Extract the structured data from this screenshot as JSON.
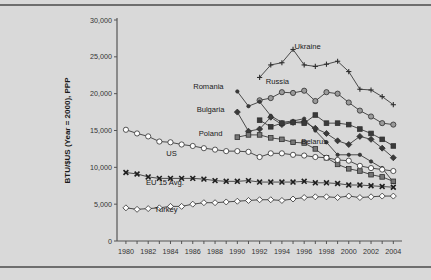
{
  "figure": {
    "background_color": "#d9d9d9",
    "rule_color": "#6e6e6e"
  },
  "chart_data": {
    "type": "line",
    "title": "",
    "xlabel": "",
    "ylabel": "BTU/$US (Year = 2000), PPP",
    "xlim": [
      1979.2,
      2004.6
    ],
    "ylim": [
      0,
      30000
    ],
    "ytick_labels": [
      "0",
      "5,000",
      "10,000",
      "15,000",
      "20,000",
      "25,000",
      "30,000"
    ],
    "ytick_values": [
      0,
      5000,
      10000,
      15000,
      20000,
      25000,
      30000
    ],
    "xtick_labels": [
      "1980",
      "1982",
      "1984",
      "1986",
      "1988",
      "1990",
      "1992",
      "1994",
      "1996",
      "1998",
      "2000",
      "2002",
      "2004"
    ],
    "xtick_values": [
      1980,
      1982,
      1984,
      1986,
      1988,
      1990,
      1992,
      1994,
      1996,
      1998,
      2000,
      2002,
      2004
    ],
    "xtick_minor_values": [
      1981,
      1983,
      1985,
      1987,
      1989,
      1991,
      1993,
      1995,
      1997,
      1999,
      2001,
      2003
    ],
    "grid": false,
    "legend_position": "inline-labels",
    "series": [
      {
        "name": "Ukraine",
        "marker": "plus",
        "marker_fill": "none",
        "label_x": 1996.3,
        "label_y": 26100,
        "x": [
          1992,
          1993,
          1994,
          1995,
          1996,
          1997,
          1998,
          1999,
          2000,
          2001,
          2002,
          2003,
          2004
        ],
        "values": [
          22200,
          23900,
          24200,
          26000,
          23900,
          23700,
          24000,
          24400,
          23000,
          20600,
          20500,
          19600,
          18500
        ]
      },
      {
        "name": "Russia",
        "marker": "circle",
        "marker_fill": "#9a9a9a",
        "label_x": 1993.6,
        "label_y": 21300,
        "x": [
          1992,
          1993,
          1994,
          1995,
          1996,
          1997,
          1998,
          1999,
          2000,
          2001,
          2002,
          2003,
          2004
        ],
        "values": [
          19100,
          19400,
          20200,
          20100,
          20400,
          19000,
          20200,
          20000,
          18800,
          17700,
          16900,
          16000,
          15800
        ]
      },
      {
        "name": "Romania",
        "marker": "dot",
        "marker_fill": "#3a3a3a",
        "label_x": 1987.4,
        "label_y": 20600,
        "x": [
          1990,
          1991,
          1992,
          1993,
          1994,
          1995,
          1996,
          1997,
          1998,
          1999,
          2000,
          2001,
          2002,
          2003,
          2004
        ],
        "values": [
          20300,
          18300,
          18900,
          17000,
          16100,
          16300,
          16600,
          15000,
          13400,
          11700,
          11700,
          11700,
          10800,
          9900,
          8000
        ]
      },
      {
        "name": "Bulgaria",
        "marker": "diamond",
        "marker_fill": "#3a3a3a",
        "label_x": 1987.6,
        "label_y": 17500,
        "x": [
          1990,
          1991,
          1992,
          1993,
          1994,
          1995,
          1996,
          1997,
          1998,
          1999,
          2000,
          2001,
          2002,
          2003,
          2004
        ],
        "values": [
          17500,
          14900,
          15200,
          16800,
          15800,
          16100,
          16200,
          15300,
          14600,
          13600,
          13100,
          14200,
          13800,
          12600,
          11300
        ]
      },
      {
        "name": "Poland",
        "marker": "square",
        "marker_fill": "#777777",
        "label_x": 1987.6,
        "label_y": 14200,
        "x": [
          1990,
          1991,
          1992,
          1993,
          1994,
          1995,
          1996,
          1997,
          1998,
          1999,
          2000,
          2001,
          2002,
          2003,
          2004
        ],
        "values": [
          14100,
          14400,
          14400,
          14000,
          13800,
          13400,
          13300,
          12500,
          11300,
          10400,
          9800,
          9500,
          9000,
          8700,
          8100
        ]
      },
      {
        "name": "Belarus",
        "marker": "square",
        "marker_fill": "#3a3a3a",
        "label_x": 1996.9,
        "label_y": 13100,
        "x": [
          1992,
          1993,
          1994,
          1995,
          1996,
          1997,
          1998,
          1999,
          2000,
          2001,
          2002,
          2003,
          2004
        ],
        "values": [
          16400,
          15500,
          16000,
          16100,
          16000,
          17100,
          16000,
          16000,
          15800,
          15200,
          14600,
          13800,
          12900
        ]
      },
      {
        "name": "US",
        "marker": "circle",
        "marker_fill": "none",
        "label_x": 1984.1,
        "label_y": 11500,
        "x": [
          1980,
          1981,
          1982,
          1983,
          1984,
          1985,
          1986,
          1987,
          1988,
          1989,
          1990,
          1991,
          1992,
          1993,
          1994,
          1995,
          1996,
          1997,
          1998,
          1999,
          2000,
          2001,
          2002,
          2003,
          2004
        ],
        "values": [
          15100,
          14600,
          14200,
          13500,
          13400,
          13100,
          12900,
          12600,
          12400,
          12200,
          12200,
          12100,
          11400,
          11900,
          11900,
          11700,
          11600,
          11400,
          11300,
          11000,
          10900,
          10200,
          9900,
          9700,
          9500
        ]
      },
      {
        "name": "EU 15 Avg.",
        "marker": "x",
        "marker_fill": "#2a2a2a",
        "label_x": 1983.5,
        "label_y": 7600,
        "x": [
          1980,
          1981,
          1982,
          1983,
          1984,
          1985,
          1986,
          1987,
          1988,
          1989,
          1990,
          1991,
          1992,
          1993,
          1994,
          1995,
          1996,
          1997,
          1998,
          1999,
          2000,
          2001,
          2002,
          2003,
          2004
        ],
        "values": [
          9300,
          9100,
          8700,
          8500,
          8500,
          8500,
          8500,
          8400,
          8200,
          8100,
          8100,
          8200,
          8000,
          8000,
          8000,
          8000,
          8100,
          7900,
          7900,
          7800,
          7600,
          7600,
          7500,
          7400,
          7300
        ]
      },
      {
        "name": "Turkey",
        "marker": "diamond",
        "marker_fill": "none",
        "label_x": 1983.6,
        "label_y": 4000,
        "x": [
          1980,
          1981,
          1982,
          1983,
          1984,
          1985,
          1986,
          1987,
          1988,
          1989,
          1990,
          1991,
          1992,
          1993,
          1994,
          1995,
          1996,
          1997,
          1998,
          1999,
          2000,
          2001,
          2002,
          2003,
          2004
        ],
        "values": [
          4500,
          4300,
          4400,
          4500,
          4700,
          4700,
          5000,
          5200,
          5200,
          5300,
          5400,
          5500,
          5600,
          5600,
          5500,
          5700,
          5900,
          6000,
          6000,
          5900,
          6100,
          5900,
          6000,
          6100,
          6100
        ]
      }
    ]
  }
}
